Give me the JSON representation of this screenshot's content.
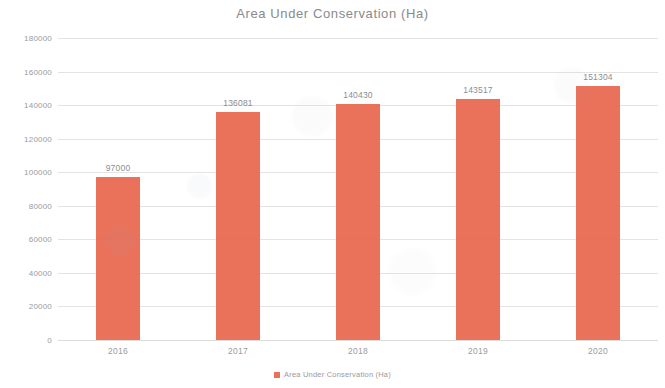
{
  "chart_data": {
    "type": "bar",
    "title": "Area Under Conservation (Ha)",
    "xlabel": "",
    "ylabel": "",
    "categories": [
      "2016",
      "2017",
      "2018",
      "2019",
      "2020"
    ],
    "values": [
      97000,
      136081,
      140430,
      143517,
      151304
    ],
    "value_labels": [
      "97000",
      "136081",
      "140430",
      "143517",
      "151304"
    ],
    "series": [
      {
        "name": "Area Under Conservation (Ha)",
        "color": "#e8664d",
        "values": [
          97000,
          136081,
          140430,
          143517,
          151304
        ]
      }
    ],
    "ylim": [
      0,
      180000
    ],
    "ytick_step": 20000,
    "ytick_labels": [
      "180000",
      "160000",
      "140000",
      "120000",
      "100000",
      "80000",
      "60000",
      "40000",
      "20000",
      "0"
    ],
    "ytick_values": [
      180000,
      160000,
      140000,
      120000,
      100000,
      80000,
      60000,
      40000,
      20000,
      0
    ],
    "grid": true,
    "legend_position": "bottom",
    "legend": [
      {
        "label": "Area Under Conservation (Ha)",
        "color": "#e8664d",
        "marker": "square"
      }
    ]
  },
  "colors": {
    "bar": "#e8664d",
    "grid": "#e3e3e3",
    "text": "#8c8c8c",
    "background": "#ffffff"
  }
}
